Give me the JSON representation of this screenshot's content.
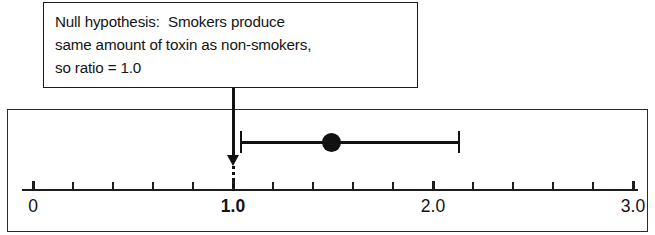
{
  "annotation": {
    "lines": [
      "Null hypothesis:  Smokers produce",
      "same amount of toxin as non-smokers,",
      "so ratio = 1.0"
    ],
    "pointer_target_value": 1.0
  },
  "chart_data": {
    "type": "scatter",
    "title": "",
    "subtitle": "",
    "xlabel": "",
    "ylabel": "",
    "xlim": [
      0.0,
      3.0
    ],
    "grid": false,
    "legend": null,
    "tick_values": [
      0.0,
      0.2,
      0.4,
      0.6,
      0.8,
      1.0,
      1.2,
      1.4,
      1.6,
      1.8,
      2.0,
      2.2,
      2.4,
      2.6,
      2.8,
      3.0
    ],
    "tick_labels": [
      {
        "value": 0.0,
        "text": "0",
        "bold": false
      },
      {
        "value": 1.0,
        "text": "1.0",
        "bold": true
      },
      {
        "value": 2.0,
        "text": "2.0",
        "bold": false
      },
      {
        "value": 3.0,
        "text": "3.0",
        "bold": false
      }
    ],
    "series": [
      {
        "name": "Smokers vs non-smokers toxin ratio",
        "estimate": 1.49,
        "ci_low": 1.04,
        "ci_high": 2.13,
        "marker": "filled-circle"
      }
    ],
    "reference_line": {
      "value": 1.0,
      "style": "dotted",
      "label": "null value"
    }
  },
  "colors": {
    "ink": "#111111",
    "frame": "#2b2b2b",
    "background": "#ffffff"
  }
}
